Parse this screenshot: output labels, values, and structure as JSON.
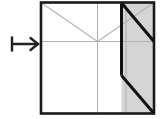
{
  "figure": {
    "kind": "paper-folding-diagram",
    "caption": "",
    "canvas": {
      "width": 164,
      "height": 119,
      "background": "#ffffff"
    },
    "colors": {
      "outline": "#1a1a1a",
      "fold_line": "#b3b3b3",
      "shade_fill": "#d4d4d4",
      "bold_crease": "#111111",
      "arrow": "#222222",
      "background": "#ffffff"
    },
    "arrow": {
      "glyph_name": "maps-to-arrow",
      "label": "↦",
      "x": 12,
      "y": 36,
      "width": 26,
      "height": 16,
      "stroke_width": 2.4,
      "bar_height": 13
    },
    "square": {
      "name": "paper-square",
      "left": 41,
      "top": 2.5,
      "right": 154,
      "bottom": 113.5,
      "stroke_width": 2.6
    },
    "fold_lines": [
      {
        "name": "vertical-center-crease",
        "x1": 97.5,
        "y1": 2.5,
        "x2": 97.5,
        "y2": 113.5,
        "width": 1.1
      },
      {
        "name": "vertical-three-quarter-crease",
        "x1": 126.0,
        "y1": 2.5,
        "x2": 126.0,
        "y2": 113.5,
        "width": 1.1
      },
      {
        "name": "horizontal-center-crease",
        "x1": 41,
        "y1": 41.5,
        "x2": 154,
        "y2": 41.5,
        "width": 1.1
      },
      {
        "name": "diagonal-crease-left",
        "x1": 41,
        "y1": 2.5,
        "x2": 97.5,
        "y2": 41.5,
        "width": 1.1
      },
      {
        "name": "diagonal-crease-right",
        "x1": 154,
        "y1": 2.5,
        "x2": 97.5,
        "y2": 41.5,
        "width": 1.1
      }
    ],
    "shaded_region": {
      "name": "folded-flap-shaded-area",
      "fill": "#d4d4d4",
      "points": "121.5,2.5 154,2.5 154,113.5 121.5,113.5"
    },
    "bold_creases": [
      {
        "name": "bold-vertical-flap-edge",
        "x1": 121.5,
        "y1": 3.5,
        "x2": 121.5,
        "y2": 75.5,
        "width": 3.0
      },
      {
        "name": "bold-diagonal-upper",
        "x1": 122.0,
        "y1": 3.5,
        "x2": 154,
        "y2": 41.5,
        "width": 3.0
      },
      {
        "name": "bold-diagonal-lower",
        "x1": 121.5,
        "y1": 75.5,
        "x2": 154,
        "y2": 113.5,
        "width": 3.0
      }
    ]
  }
}
